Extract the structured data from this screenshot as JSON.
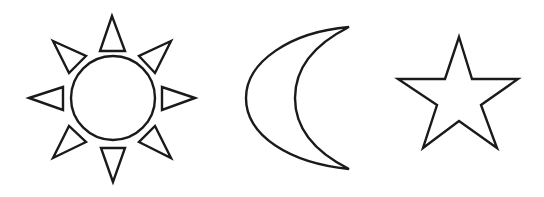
{
  "figure": {
    "stroke_color": "#1a1a1a",
    "fill_color": "#ffffff",
    "background": "#ffffff",
    "shapes": [
      {
        "name": "sun",
        "label": "Sun"
      },
      {
        "name": "moon",
        "label": "Crescent moon"
      },
      {
        "name": "star",
        "label": "Five-pointed star"
      }
    ]
  }
}
